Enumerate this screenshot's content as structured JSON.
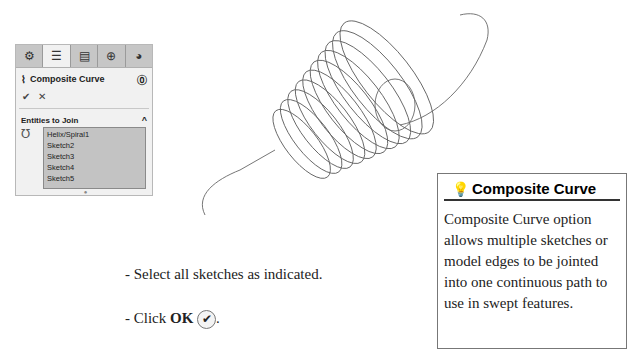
{
  "panel": {
    "tabs": [
      {
        "icon": "feature-manager-icon",
        "glyph": "⚙"
      },
      {
        "icon": "property-manager-icon",
        "glyph": "☰"
      },
      {
        "icon": "configuration-manager-icon",
        "glyph": "▤"
      },
      {
        "icon": "dimxpert-icon",
        "glyph": "⊕"
      },
      {
        "icon": "display-manager-icon",
        "glyph": "◕"
      }
    ],
    "title": "Composite Curve",
    "title_icon": "⌇",
    "help_icon": "⓪",
    "ok_glyph": "✔",
    "cancel_glyph": "✕",
    "section": "Entities to Join",
    "section_chevron": "^",
    "entities": [
      "Helix/Spiral1",
      "Sketch2",
      "Sketch3",
      "Sketch4",
      "Sketch5"
    ]
  },
  "instructions": {
    "line1": "- Select all sketches as indicated.",
    "line2_prefix": "- Click ",
    "line2_bold": "OK",
    "line2_suffix": "."
  },
  "tip": {
    "title": "Composite Curve",
    "body": "Composite Curve option allows multiple sketches or model edges to be jointed into one continuous path to use in swept features."
  }
}
